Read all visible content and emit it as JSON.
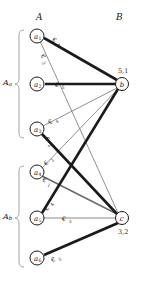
{
  "diagram": {
    "title_columns": {
      "left": "A",
      "right": "B"
    },
    "group_labels": [
      {
        "id": "Aa",
        "text": "A",
        "sub": "a"
      },
      {
        "id": "Ab",
        "text": "A",
        "sub": "b"
      }
    ],
    "left_nodes": [
      {
        "id": "a1",
        "letter": "a",
        "sub": "1",
        "cx": 37,
        "cy": 36
      },
      {
        "id": "a2",
        "letter": "a",
        "sub": "2",
        "cx": 37,
        "cy": 84
      },
      {
        "id": "a3",
        "letter": "a",
        "sub": "3",
        "cx": 37,
        "cy": 129
      },
      {
        "id": "a4",
        "letter": "a",
        "sub": "4",
        "cx": 37,
        "cy": 172
      },
      {
        "id": "a5",
        "letter": "a",
        "sub": "5",
        "cx": 37,
        "cy": 218
      },
      {
        "id": "a6",
        "letter": "a",
        "sub": "6",
        "cx": 37,
        "cy": 258
      }
    ],
    "right_nodes": [
      {
        "id": "b",
        "letter": "b",
        "cx": 122,
        "cy": 84,
        "weight": "5,1",
        "weight_x": 120,
        "weight_y": 72
      },
      {
        "id": "c",
        "letter": "c",
        "cx": 122,
        "cy": 218,
        "weight": "3,2",
        "weight_x": 120,
        "weight_y": 232
      }
    ],
    "edges": [
      {
        "id": "e-a1-b",
        "from": "a1",
        "to": "b",
        "weight": "4",
        "symbol": "€",
        "thick": true,
        "lx": 58,
        "ly": 42
      },
      {
        "id": "e-a1-c",
        "from": "a1",
        "to": "c",
        "weight": "3",
        "symbol": "€",
        "thick": false,
        "lx": 45,
        "ly": 60
      },
      {
        "id": "e-a2-b",
        "from": "a2",
        "to": "b",
        "weight": "5",
        "symbol": "€",
        "thick": true,
        "lx": 62,
        "ly": 86
      },
      {
        "id": "e-a3-b",
        "from": "a3",
        "to": "b",
        "weight": "4",
        "symbol": "€",
        "thick": false,
        "lx": 54,
        "ly": 120
      },
      {
        "id": "e-a3-c",
        "from": "a3",
        "to": "c",
        "weight": "2",
        "symbol": "€",
        "thick": true,
        "lx": 50,
        "ly": 142
      },
      {
        "id": "e-a4-b",
        "from": "a4",
        "to": "b",
        "weight": "2",
        "symbol": "€",
        "thick": false,
        "lx": 49,
        "ly": 160
      },
      {
        "id": "e-a4-c",
        "from": "a4",
        "to": "c",
        "weight": "1",
        "symbol": "€",
        "thick": false,
        "lx": 48,
        "ly": 182
      },
      {
        "id": "e-a5-b",
        "from": "a5",
        "to": "b",
        "weight": "4",
        "symbol": "€",
        "thick": true,
        "lx": 49,
        "ly": 205
      },
      {
        "id": "e-a5-c",
        "from": "a5",
        "to": "c",
        "weight": "3",
        "symbol": "€",
        "thick": false,
        "lx": 68,
        "ly": 220
      },
      {
        "id": "e-a6-c",
        "from": "a6",
        "to": "c",
        "weight": "5",
        "symbol": "€",
        "thick": true,
        "lx": 57,
        "ly": 258
      }
    ],
    "colors": {
      "stroke": "#1a1a1a",
      "thin_stroke": "#6e6e6e",
      "node_fill": "#ffffff",
      "bracket": "#8a8a8a",
      "background": "#ffffff"
    }
  }
}
